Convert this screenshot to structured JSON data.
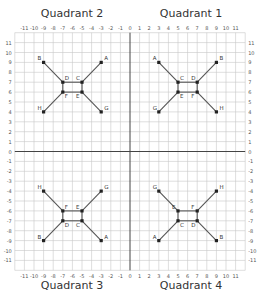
{
  "quadrant_labels": {
    "q1": "Quadrant 1",
    "q2": "Quadrant 2",
    "q3": "Quadrant 3",
    "q4": "Quadrant 4"
  },
  "axes": {
    "x_ticks": [
      -11,
      -10,
      -9,
      -8,
      -7,
      -6,
      -5,
      -4,
      -3,
      -2,
      -1,
      0,
      1,
      2,
      3,
      4,
      5,
      6,
      7,
      8,
      9,
      10,
      11
    ],
    "y_ticks": [
      -11,
      -10,
      -9,
      -8,
      -7,
      -6,
      -5,
      -4,
      -3,
      -2,
      -1,
      0,
      1,
      2,
      3,
      4,
      5,
      6,
      7,
      8,
      9,
      10,
      11
    ],
    "range": [
      -12,
      12
    ]
  },
  "colors": {
    "grid": "#c8c8c8",
    "axis": "#444444",
    "line": "#555555",
    "point": "#222222"
  },
  "figures": [
    {
      "quadrant": "Quadrant 1",
      "points": {
        "A": [
          3,
          9
        ],
        "B": [
          9,
          9
        ],
        "C": [
          5,
          7
        ],
        "D": [
          7,
          7
        ],
        "E": [
          5,
          6
        ],
        "F": [
          7,
          6
        ],
        "G": [
          3,
          4
        ],
        "H": [
          9,
          4
        ]
      },
      "segments": [
        [
          "A",
          "C"
        ],
        [
          "B",
          "D"
        ],
        [
          "C",
          "D"
        ],
        [
          "D",
          "F"
        ],
        [
          "F",
          "E"
        ],
        [
          "E",
          "C"
        ],
        [
          "E",
          "G"
        ],
        [
          "F",
          "H"
        ]
      ],
      "label_offsets": {
        "A": [
          -6,
          -2
        ],
        "B": [
          3,
          -2
        ],
        "C": [
          2,
          -2
        ],
        "D": [
          -6,
          -2
        ],
        "E": [
          2,
          6
        ],
        "F": [
          -6,
          6
        ],
        "G": [
          -6,
          -2
        ],
        "H": [
          3,
          -2
        ]
      }
    },
    {
      "quadrant": "Quadrant 2",
      "points": {
        "A": [
          -3,
          9
        ],
        "B": [
          -9,
          9
        ],
        "C": [
          -5,
          7
        ],
        "D": [
          -7,
          7
        ],
        "E": [
          -5,
          6
        ],
        "F": [
          -7,
          6
        ],
        "G": [
          -3,
          4
        ],
        "H": [
          -9,
          4
        ]
      },
      "segments": [
        [
          "A",
          "C"
        ],
        [
          "B",
          "D"
        ],
        [
          "C",
          "D"
        ],
        [
          "D",
          "F"
        ],
        [
          "F",
          "E"
        ],
        [
          "E",
          "C"
        ],
        [
          "E",
          "G"
        ],
        [
          "F",
          "H"
        ]
      ],
      "label_offsets": {
        "A": [
          3,
          -2
        ],
        "B": [
          -6,
          -2
        ],
        "C": [
          -6,
          -2
        ],
        "D": [
          2,
          -2
        ],
        "E": [
          -6,
          6
        ],
        "F": [
          2,
          6
        ],
        "G": [
          3,
          -2
        ],
        "H": [
          -6,
          -2
        ]
      }
    },
    {
      "quadrant": "Quadrant 3",
      "points": {
        "A": [
          -3,
          -9
        ],
        "B": [
          -9,
          -9
        ],
        "C": [
          -5,
          -7
        ],
        "D": [
          -7,
          -7
        ],
        "E": [
          -5,
          -6
        ],
        "F": [
          -7,
          -6
        ],
        "G": [
          -3,
          -4
        ],
        "H": [
          -9,
          -4
        ]
      },
      "segments": [
        [
          "A",
          "C"
        ],
        [
          "B",
          "D"
        ],
        [
          "C",
          "D"
        ],
        [
          "D",
          "F"
        ],
        [
          "F",
          "E"
        ],
        [
          "E",
          "C"
        ],
        [
          "E",
          "G"
        ],
        [
          "F",
          "H"
        ]
      ],
      "label_offsets": {
        "A": [
          3,
          -2
        ],
        "B": [
          -6,
          -2
        ],
        "C": [
          -6,
          6
        ],
        "D": [
          2,
          6
        ],
        "E": [
          -6,
          -2
        ],
        "F": [
          2,
          -2
        ],
        "G": [
          3,
          -2
        ],
        "H": [
          -6,
          -2
        ]
      }
    },
    {
      "quadrant": "Quadrant 4",
      "points": {
        "A": [
          3,
          -9
        ],
        "B": [
          9,
          -9
        ],
        "C": [
          5,
          -7
        ],
        "D": [
          7,
          -7
        ],
        "E": [
          5,
          -6
        ],
        "F": [
          7,
          -6
        ],
        "G": [
          3,
          -4
        ],
        "H": [
          9,
          -4
        ]
      },
      "segments": [
        [
          "A",
          "C"
        ],
        [
          "B",
          "D"
        ],
        [
          "C",
          "D"
        ],
        [
          "D",
          "F"
        ],
        [
          "F",
          "E"
        ],
        [
          "E",
          "C"
        ],
        [
          "E",
          "G"
        ],
        [
          "F",
          "H"
        ]
      ],
      "label_offsets": {
        "A": [
          -6,
          -2
        ],
        "B": [
          3,
          -2
        ],
        "C": [
          2,
          6
        ],
        "D": [
          -6,
          6
        ],
        "E": [
          -6,
          -2
        ],
        "F": [
          -6,
          -2
        ],
        "G": [
          -6,
          -2
        ],
        "H": [
          3,
          -2
        ]
      }
    }
  ]
}
